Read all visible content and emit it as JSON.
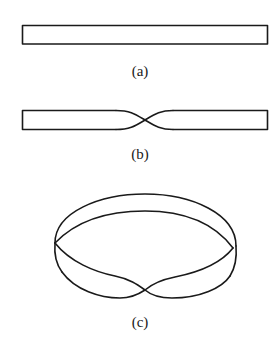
{
  "figure": {
    "panels": [
      {
        "id": "a",
        "label": "(a)",
        "description": "flat rectangular strip"
      },
      {
        "id": "b",
        "label": "(b)",
        "description": "strip with a half-twist in the middle"
      },
      {
        "id": "c",
        "label": "(c)",
        "description": "ends joined to form a Möbius strip"
      }
    ],
    "stroke_color": "#1a1a1a",
    "background": "#ffffff"
  }
}
